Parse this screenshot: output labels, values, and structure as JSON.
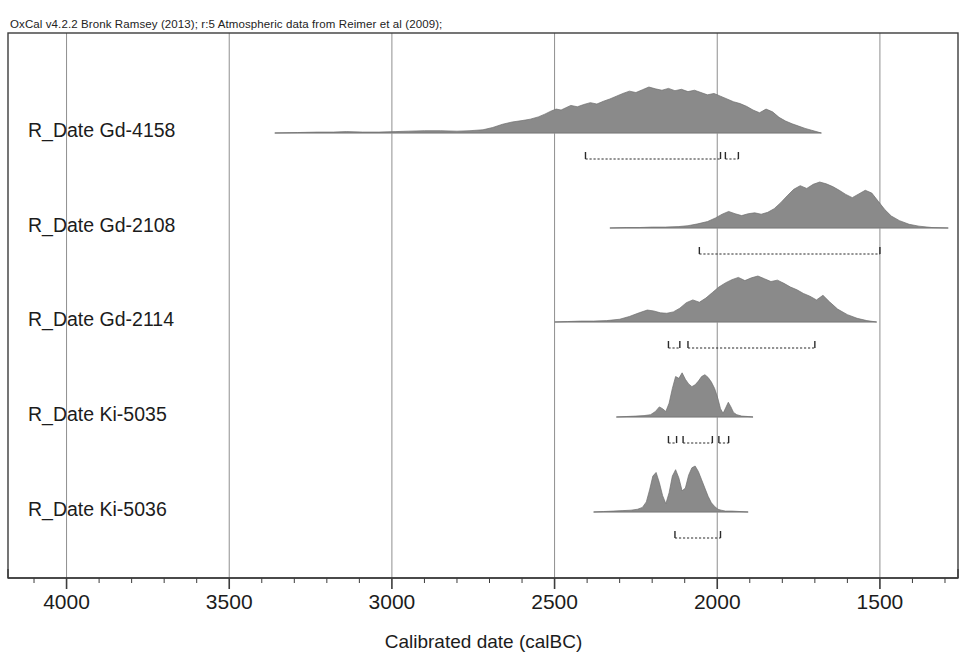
{
  "header": {
    "note": "OxCal v4.2.2 Bronk Ramsey (2013); r:5 Atmospheric data from Reimer et al (2009);"
  },
  "axis": {
    "title": "Calibrated date (calBC)",
    "ticks": [
      {
        "label": "4000",
        "value": 4000
      },
      {
        "label": "3500",
        "value": 3500
      },
      {
        "label": "3000",
        "value": 3000
      },
      {
        "label": "2500",
        "value": 2500
      },
      {
        "label": "2000",
        "value": 2000
      },
      {
        "label": "1500",
        "value": 1500
      }
    ],
    "minor_step": 100,
    "range_left": 4180,
    "range_right": 1260,
    "gridlines": [
      4000,
      3500,
      3000,
      2500,
      2000,
      1500
    ]
  },
  "colors": {
    "distribution_fill": "#8a8a8a",
    "distribution_stroke": "#6e6e6e",
    "gridline": "#8f8f8f",
    "border": "#3c3c3c",
    "baseline": "#b5b5b5",
    "bracket": "#2b2b2b",
    "text": "#1c1c1c"
  },
  "chart_data": {
    "type": "area",
    "title": "OxCal v4.2.2 Bronk Ramsey (2013); r:5 Atmospheric data from Reimer et al (2009);",
    "xlabel": "Calibrated date (calBC)",
    "ylabel": "",
    "xlim": [
      4180,
      1260
    ],
    "x_axis_direction": "reverse",
    "grid": true,
    "legend": false,
    "series": [
      {
        "name": "R_Date Gd-4158",
        "baseline_start": 3360,
        "baseline_end": 1680,
        "density_x": [
          3360,
          3290,
          3230,
          3180,
          3140,
          3090,
          3040,
          2990,
          2950,
          2900,
          2850,
          2800,
          2760,
          2720,
          2690,
          2660,
          2630,
          2600,
          2575,
          2550,
          2530,
          2510,
          2495,
          2480,
          2465,
          2450,
          2430,
          2410,
          2390,
          2370,
          2350,
          2330,
          2310,
          2290,
          2270,
          2250,
          2230,
          2210,
          2190,
          2170,
          2150,
          2130,
          2110,
          2090,
          2070,
          2050,
          2030,
          2010,
          1990,
          1970,
          1950,
          1930,
          1910,
          1890,
          1870,
          1850,
          1830,
          1810,
          1790,
          1770,
          1750,
          1730,
          1710,
          1690,
          1680
        ],
        "density_y": [
          0.0,
          0.01,
          0.02,
          0.02,
          0.03,
          0.02,
          0.02,
          0.03,
          0.04,
          0.05,
          0.05,
          0.04,
          0.05,
          0.07,
          0.12,
          0.19,
          0.24,
          0.27,
          0.3,
          0.35,
          0.41,
          0.48,
          0.52,
          0.5,
          0.55,
          0.6,
          0.57,
          0.62,
          0.66,
          0.63,
          0.69,
          0.74,
          0.8,
          0.86,
          0.91,
          0.88,
          0.94,
          1.0,
          0.96,
          0.93,
          0.97,
          0.92,
          0.95,
          0.9,
          0.93,
          0.88,
          0.83,
          0.86,
          0.8,
          0.74,
          0.68,
          0.64,
          0.58,
          0.5,
          0.44,
          0.52,
          0.46,
          0.34,
          0.26,
          0.2,
          0.15,
          0.1,
          0.06,
          0.02,
          0.0
        ],
        "ranges": [
          {
            "from": 2405,
            "to": 1990,
            "sigma": "2"
          },
          {
            "from": 1975,
            "to": 1935,
            "sigma": "2"
          }
        ]
      },
      {
        "name": "R_Date Gd-2108",
        "baseline_start": 2330,
        "baseline_end": 1290,
        "density_x": [
          2330,
          2280,
          2240,
          2200,
          2160,
          2120,
          2090,
          2060,
          2030,
          2005,
          1985,
          1965,
          1945,
          1925,
          1905,
          1885,
          1865,
          1845,
          1825,
          1805,
          1785,
          1765,
          1745,
          1725,
          1705,
          1685,
          1665,
          1645,
          1625,
          1605,
          1585,
          1565,
          1545,
          1525,
          1505,
          1485,
          1465,
          1440,
          1410,
          1380,
          1340,
          1290
        ],
        "density_y": [
          0.0,
          0.01,
          0.01,
          0.02,
          0.02,
          0.03,
          0.05,
          0.09,
          0.14,
          0.22,
          0.3,
          0.36,
          0.31,
          0.27,
          0.31,
          0.33,
          0.3,
          0.34,
          0.42,
          0.55,
          0.7,
          0.84,
          0.92,
          0.86,
          0.95,
          1.0,
          0.96,
          0.9,
          0.82,
          0.73,
          0.66,
          0.74,
          0.82,
          0.76,
          0.58,
          0.4,
          0.26,
          0.16,
          0.08,
          0.04,
          0.01,
          0.0
        ],
        "ranges": [
          {
            "from": 2055,
            "to": 1500,
            "sigma": "2"
          }
        ]
      },
      {
        "name": "R_Date Gd-2114",
        "baseline_start": 2500,
        "baseline_end": 1510,
        "density_x": [
          2500,
          2460,
          2420,
          2380,
          2340,
          2300,
          2270,
          2240,
          2215,
          2195,
          2175,
          2155,
          2135,
          2115,
          2095,
          2075,
          2055,
          2035,
          2015,
          1995,
          1975,
          1955,
          1935,
          1915,
          1895,
          1875,
          1855,
          1835,
          1815,
          1795,
          1775,
          1755,
          1735,
          1715,
          1695,
          1675,
          1655,
          1630,
          1600,
          1570,
          1540,
          1510
        ],
        "density_y": [
          0.0,
          0.01,
          0.02,
          0.02,
          0.03,
          0.06,
          0.12,
          0.2,
          0.26,
          0.24,
          0.2,
          0.19,
          0.22,
          0.3,
          0.42,
          0.48,
          0.43,
          0.52,
          0.64,
          0.76,
          0.85,
          0.92,
          0.97,
          0.9,
          0.96,
          1.0,
          0.94,
          0.88,
          0.91,
          0.84,
          0.76,
          0.7,
          0.62,
          0.56,
          0.48,
          0.58,
          0.44,
          0.28,
          0.16,
          0.08,
          0.03,
          0.0
        ],
        "ranges": [
          {
            "from": 2150,
            "to": 2115,
            "sigma": "2"
          },
          {
            "from": 2090,
            "to": 1700,
            "sigma": "2"
          }
        ]
      },
      {
        "name": "R_Date Ki-5035",
        "baseline_start": 2310,
        "baseline_end": 1890,
        "density_x": [
          2310,
          2280,
          2250,
          2225,
          2205,
          2190,
          2178,
          2168,
          2158,
          2148,
          2138,
          2128,
          2118,
          2108,
          2098,
          2088,
          2078,
          2068,
          2058,
          2048,
          2038,
          2028,
          2018,
          2008,
          1998,
          1990,
          1982,
          1974,
          1966,
          1958,
          1950,
          1940,
          1925,
          1905,
          1890
        ],
        "density_y": [
          0.0,
          0.01,
          0.02,
          0.03,
          0.05,
          0.12,
          0.22,
          0.18,
          0.12,
          0.3,
          0.62,
          0.88,
          0.84,
          0.96,
          0.82,
          0.72,
          0.66,
          0.7,
          0.78,
          0.88,
          0.92,
          0.86,
          0.76,
          0.62,
          0.4,
          0.18,
          0.08,
          0.2,
          0.32,
          0.22,
          0.1,
          0.05,
          0.02,
          0.01,
          0.0
        ],
        "ranges": [
          {
            "from": 2150,
            "to": 2125,
            "sigma": "2"
          },
          {
            "from": 2105,
            "to": 2015,
            "sigma": "2"
          },
          {
            "from": 1995,
            "to": 1965,
            "sigma": "2"
          }
        ]
      },
      {
        "name": "R_Date Ki-5036",
        "baseline_start": 2380,
        "baseline_end": 1905,
        "density_x": [
          2380,
          2350,
          2320,
          2290,
          2265,
          2245,
          2230,
          2218,
          2208,
          2198,
          2188,
          2178,
          2168,
          2158,
          2148,
          2138,
          2128,
          2118,
          2108,
          2098,
          2088,
          2078,
          2068,
          2058,
          2048,
          2038,
          2028,
          2018,
          2008,
          1998,
          1988,
          1975,
          1955,
          1930,
          1905
        ],
        "density_y": [
          0.0,
          0.01,
          0.02,
          0.03,
          0.04,
          0.06,
          0.1,
          0.22,
          0.48,
          0.78,
          0.86,
          0.64,
          0.36,
          0.18,
          0.42,
          0.78,
          0.92,
          0.74,
          0.46,
          0.52,
          0.8,
          0.96,
          1.0,
          0.88,
          0.7,
          0.52,
          0.34,
          0.2,
          0.12,
          0.06,
          0.04,
          0.02,
          0.02,
          0.01,
          0.0
        ],
        "ranges": [
          {
            "from": 2130,
            "to": 1990,
            "sigma": "2"
          }
        ]
      }
    ]
  }
}
